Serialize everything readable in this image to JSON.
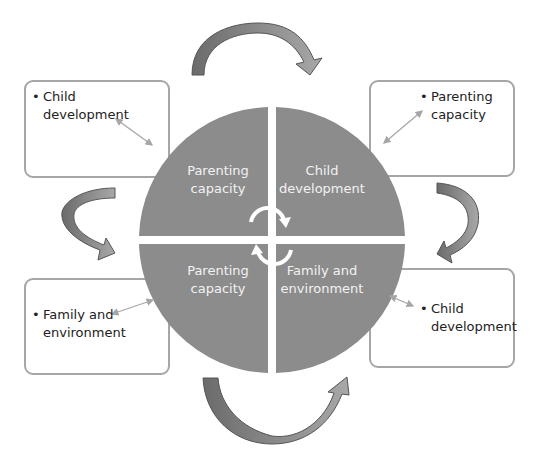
{
  "diagram": {
    "quadrants": [
      {
        "id": "top-left",
        "lines": [
          "Parenting",
          "capacity"
        ]
      },
      {
        "id": "top-right",
        "lines": [
          "Child",
          "development"
        ]
      },
      {
        "id": "bottom-left",
        "lines": [
          "Parenting",
          "capacity"
        ]
      },
      {
        "id": "bottom-right",
        "lines": [
          "Family and",
          "environment"
        ]
      }
    ],
    "boxes": [
      {
        "id": "top-left",
        "bullet": "•",
        "lines": [
          "Child",
          "development"
        ]
      },
      {
        "id": "top-right",
        "bullet": "•",
        "lines": [
          "Parenting",
          "capacity"
        ]
      },
      {
        "id": "bottom-left",
        "bullet": "•",
        "lines": [
          "Family and",
          "environment"
        ]
      },
      {
        "id": "bottom-right",
        "bullet": "•",
        "lines": [
          "Child",
          "development"
        ]
      }
    ],
    "colors": {
      "circle": "#8c8c8c",
      "arrow_dark": "#6b6b6b",
      "arrow_light": "#a0a0a0",
      "box_border": "#a6a6a6",
      "connector": "#a6a6a6"
    }
  }
}
